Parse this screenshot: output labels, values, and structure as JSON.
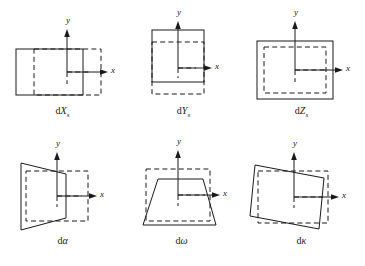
{
  "figure": {
    "stroke_color": "#1a1a1a",
    "background_color": "#ffffff",
    "dashed_style": "reference rectangle",
    "solid_style": "displaced shape"
  },
  "panels": [
    {
      "id": "dXs",
      "caption_main": "d",
      "caption_var": "X",
      "caption_sub": "s",
      "caption_text": "dXs",
      "x_axis_label": "x",
      "y_axis_label": "y",
      "shape_type": "rectangle-translated-x",
      "meaning": "translation along X"
    },
    {
      "id": "dYs",
      "caption_main": "d",
      "caption_var": "Y",
      "caption_sub": "s",
      "caption_text": "dYs",
      "x_axis_label": "x",
      "y_axis_label": "y",
      "shape_type": "rectangle-translated-y",
      "meaning": "translation along Y"
    },
    {
      "id": "dZs",
      "caption_main": "d",
      "caption_var": "Z",
      "caption_sub": "s",
      "caption_text": "dZs",
      "x_axis_label": "x",
      "y_axis_label": "y",
      "shape_type": "rectangle-scaled",
      "meaning": "scale change along Z"
    },
    {
      "id": "dalpha",
      "caption_main": "d",
      "caption_var": "α",
      "caption_sub": "",
      "caption_text": "dα",
      "x_axis_label": "x",
      "y_axis_label": "y",
      "shape_type": "trapezoid-horizontal",
      "meaning": "rotation about Y (alpha)"
    },
    {
      "id": "domega",
      "caption_main": "d",
      "caption_var": "ω",
      "caption_sub": "",
      "caption_text": "dω",
      "x_axis_label": "x",
      "y_axis_label": "y",
      "shape_type": "trapezoid-vertical",
      "meaning": "rotation about X (omega)"
    },
    {
      "id": "dkappa",
      "caption_main": "d",
      "caption_var": "κ",
      "caption_sub": "",
      "caption_text": "dκ",
      "x_axis_label": "x",
      "y_axis_label": "y",
      "shape_type": "rectangle-rotated",
      "meaning": "rotation about Z (kappa)"
    }
  ]
}
